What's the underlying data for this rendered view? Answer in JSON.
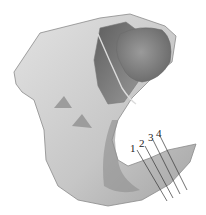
{
  "figure": {
    "colors": {
      "bone_light": "#d8d8d8",
      "bone_mid": "#b4b4b4",
      "bone_dark": "#7a7a7a",
      "socket_dark": "#6e6e6e",
      "outline": "#8a8a8a",
      "leader_line": "#333333",
      "background": "#ffffff"
    },
    "labels": [
      {
        "text": "1",
        "x": 130,
        "y": 143
      },
      {
        "text": "2",
        "x": 139,
        "y": 138
      },
      {
        "text": "3",
        "x": 148,
        "y": 132
      },
      {
        "text": "4",
        "x": 156,
        "y": 128
      }
    ]
  }
}
